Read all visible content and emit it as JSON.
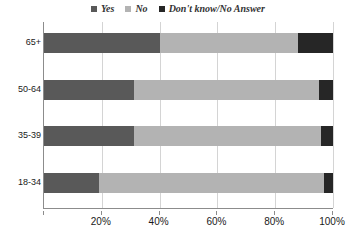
{
  "chart_data": {
    "type": "bar",
    "orientation": "horizontal",
    "stacked": true,
    "title": "",
    "xlabel": "",
    "ylabel": "",
    "categories": [
      "65+",
      "50-64",
      "35-39",
      "18-34"
    ],
    "series": [
      {
        "name": "Yes",
        "color": "#595959",
        "values": [
          40,
          31,
          31,
          19
        ]
      },
      {
        "name": "No",
        "color": "#b3b3b3",
        "values": [
          48,
          64,
          65,
          78
        ]
      },
      {
        "name": "Don't know/No Answer",
        "color": "#262626",
        "values": [
          12,
          5,
          4,
          3
        ]
      }
    ],
    "xlim": [
      0,
      100
    ],
    "xticks": [
      0,
      20,
      40,
      60,
      80,
      100
    ],
    "xticklabels": [
      "",
      "20%",
      "40%",
      "60%",
      "80%",
      "100%"
    ],
    "grid": true,
    "grid_axis": "x",
    "legend_position": "top-center",
    "units": "percent"
  },
  "legend": {
    "items": [
      {
        "label": "Yes",
        "color": "#595959"
      },
      {
        "label": "No",
        "color": "#b3b3b3"
      },
      {
        "label": "Don't know/No Answer",
        "color": "#262626"
      }
    ]
  },
  "axis": {
    "line_color": "#8c8c8c",
    "grid_color": "#d4d4d4"
  }
}
